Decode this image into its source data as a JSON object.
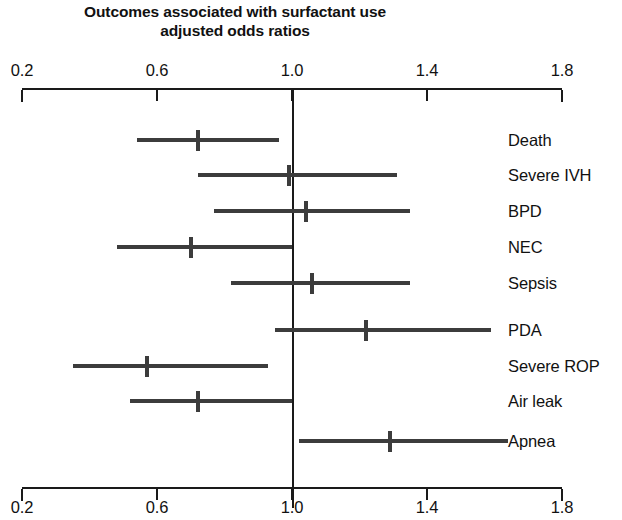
{
  "title": {
    "line1": "Outcomes associated with surfactant use",
    "line2": "adjusted odds ratios"
  },
  "axis": {
    "ticks": [
      "0.2",
      "0.6",
      "1.0",
      "1.4",
      "1.8"
    ]
  },
  "chart_data": {
    "type": "bar",
    "subtype": "forest-plot",
    "title": "Outcomes associated with surfactant use adjusted odds ratios",
    "xlabel": "",
    "ylabel": "",
    "xlim": [
      0.2,
      1.8
    ],
    "xticks": [
      0.2,
      0.6,
      1.0,
      1.4,
      1.8
    ],
    "grid": false,
    "legend": null,
    "reference_line": 1.0,
    "measure": "adjusted odds ratio",
    "categories": [
      "Death",
      "Severe IVH",
      "BPD",
      "NEC",
      "Sepsis",
      "PDA",
      "Severe ROP",
      "Air leak",
      "Apnea"
    ],
    "values": [
      0.72,
      0.99,
      1.04,
      0.7,
      1.06,
      1.22,
      0.57,
      0.72,
      1.29
    ],
    "ci_low": [
      0.54,
      0.72,
      0.77,
      0.48,
      0.82,
      0.95,
      0.35,
      0.52,
      1.02
    ],
    "ci_high": [
      0.96,
      1.31,
      1.35,
      1.0,
      1.35,
      1.59,
      0.93,
      1.0,
      1.64
    ],
    "rows": [
      {
        "label": "Death",
        "value": 0.72,
        "low": 0.54,
        "high": 0.96
      },
      {
        "label": "Severe IVH",
        "value": 0.99,
        "low": 0.72,
        "high": 1.31
      },
      {
        "label": "BPD",
        "value": 1.04,
        "low": 0.77,
        "high": 1.35
      },
      {
        "label": "NEC",
        "value": 0.7,
        "low": 0.48,
        "high": 1.0
      },
      {
        "label": "Sepsis",
        "value": 1.06,
        "low": 0.82,
        "high": 1.35
      },
      {
        "label": "PDA",
        "value": 1.22,
        "low": 0.95,
        "high": 1.59
      },
      {
        "label": "Severe ROP",
        "value": 0.57,
        "low": 0.35,
        "high": 0.93
      },
      {
        "label": "Air leak",
        "value": 0.72,
        "low": 0.52,
        "high": 1.0
      },
      {
        "label": "Apnea",
        "value": 1.29,
        "low": 1.02,
        "high": 1.64
      }
    ]
  },
  "colors": {
    "axis": "#1a1a1a",
    "marker": "#3c3c3c",
    "background": "#ffffff"
  }
}
